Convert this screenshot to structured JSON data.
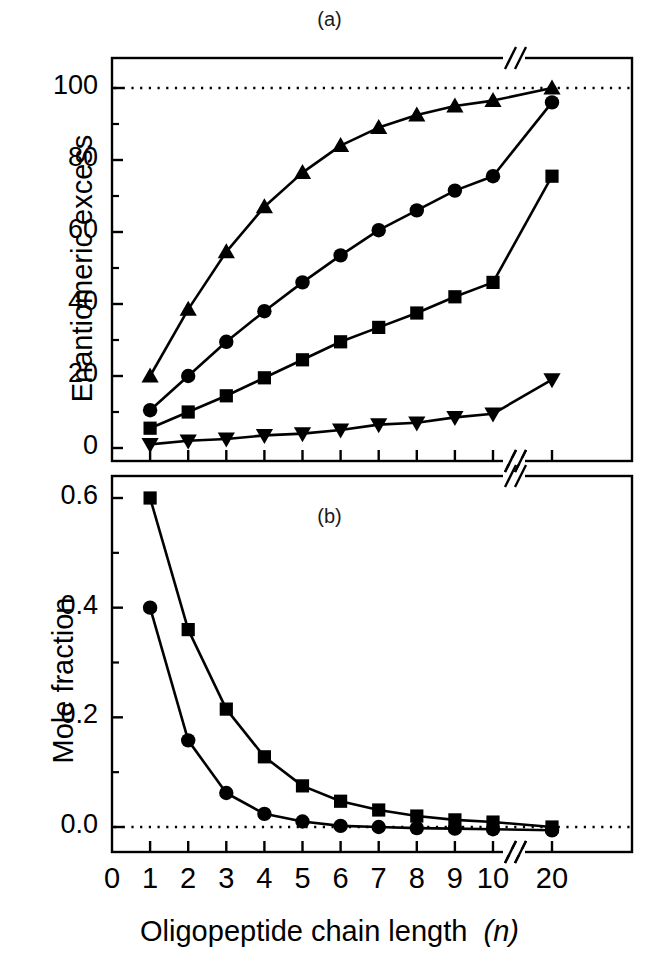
{
  "figure": {
    "panel_a_label": "(a)",
    "panel_b_label": "(b)",
    "xlabel_text": "Oligopeptide chain length",
    "xlabel_symbol": "(n)"
  },
  "chart_data": [
    {
      "type": "line",
      "panel": "(a)",
      "title": "(a)",
      "xlabel": "Oligopeptide chain length (n)",
      "ylabel": "Enantiomeric excess",
      "x": [
        1,
        2,
        3,
        4,
        5,
        6,
        7,
        8,
        9,
        10,
        20
      ],
      "xtick_labels": [
        "0",
        "1",
        "2",
        "3",
        "4",
        "5",
        "6",
        "7",
        "8",
        "9",
        "10",
        "20"
      ],
      "xtick_values": [
        0,
        1,
        2,
        3,
        4,
        5,
        6,
        7,
        8,
        9,
        10,
        20
      ],
      "ytick_labels": [
        "0",
        "20",
        "40",
        "60",
        "80",
        "100"
      ],
      "ytick_values": [
        0,
        20,
        40,
        60,
        80,
        100
      ],
      "ylim": [
        -6,
        112
      ],
      "xlim": [
        0,
        20
      ],
      "axis_break_x": true,
      "axis_break_after": 10,
      "grid": false,
      "legend": "none",
      "reference_line": {
        "y": 100,
        "style": "dotted"
      },
      "series": [
        {
          "name": "triangle-up",
          "marker": "triangle-up",
          "values": [
            20,
            38.5,
            54.5,
            67,
            76.5,
            84,
            89,
            92.5,
            95,
            96.5,
            100
          ]
        },
        {
          "name": "circle",
          "marker": "circle",
          "values": [
            10.5,
            20,
            29.5,
            38,
            46,
            53.5,
            60.5,
            66,
            71.5,
            75.5,
            96
          ]
        },
        {
          "name": "square",
          "marker": "square",
          "values": [
            5.5,
            10,
            14.5,
            19.5,
            24.5,
            29.5,
            33.5,
            37.5,
            42,
            46,
            75.5
          ]
        },
        {
          "name": "triangle-down",
          "marker": "triangle-down",
          "values": [
            1,
            2,
            2.5,
            3.5,
            4,
            5,
            6.5,
            7,
            8.5,
            9.5,
            19
          ]
        }
      ]
    },
    {
      "type": "line",
      "panel": "(b)",
      "title": "(b)",
      "xlabel": "Oligopeptide chain length (n)",
      "ylabel": "Mole fraction",
      "x": [
        1,
        2,
        3,
        4,
        5,
        6,
        7,
        8,
        9,
        10,
        20
      ],
      "xtick_labels": [
        "0",
        "1",
        "2",
        "3",
        "4",
        "5",
        "6",
        "7",
        "8",
        "9",
        "10",
        "20"
      ],
      "xtick_values": [
        0,
        1,
        2,
        3,
        4,
        5,
        6,
        7,
        8,
        9,
        10,
        20
      ],
      "ytick_labels": [
        "0.0",
        "0.2",
        "0.4",
        "0.6"
      ],
      "ytick_values": [
        0.0,
        0.2,
        0.4,
        0.6
      ],
      "ylim": [
        -0.025,
        0.665
      ],
      "xlim": [
        0,
        20
      ],
      "axis_break_x": true,
      "axis_break_after": 10,
      "grid": false,
      "legend": "none",
      "reference_line": {
        "y": 0.0,
        "style": "dotted"
      },
      "series": [
        {
          "name": "square",
          "marker": "square",
          "values": [
            0.6,
            0.36,
            0.215,
            0.128,
            0.075,
            0.047,
            0.031,
            0.02,
            0.013,
            0.009,
            0.0
          ]
        },
        {
          "name": "circle",
          "marker": "circle",
          "values": [
            0.4,
            0.158,
            0.062,
            0.024,
            0.01,
            0.002,
            0.0,
            -0.002,
            -0.003,
            -0.004,
            -0.006
          ]
        }
      ]
    }
  ]
}
